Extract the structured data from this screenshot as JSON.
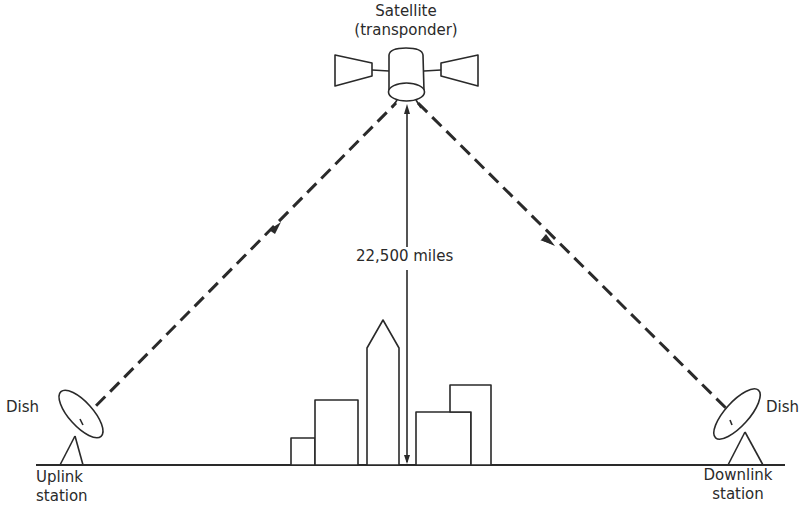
{
  "diagram": {
    "type": "satellite-communication-link",
    "colors": {
      "ink": "#2a2a2a",
      "background": "#ffffff"
    },
    "satellite": {
      "label_line1": "Satellite",
      "label_line2": "(transponder)"
    },
    "distance": {
      "label": "22,500 miles"
    },
    "uplink": {
      "dish_label": "Dish",
      "station_line1": "Uplink",
      "station_line2": "station"
    },
    "downlink": {
      "dish_label": "Dish",
      "station_line1": "Downlink",
      "station_line2": "station"
    },
    "links": [
      {
        "name": "uplink-beam",
        "from": "uplink-dish",
        "to": "satellite",
        "style": "dashed",
        "arrow": "toward-satellite"
      },
      {
        "name": "downlink-beam",
        "from": "satellite",
        "to": "downlink-dish",
        "style": "dashed",
        "arrow": "toward-downlink"
      }
    ]
  }
}
